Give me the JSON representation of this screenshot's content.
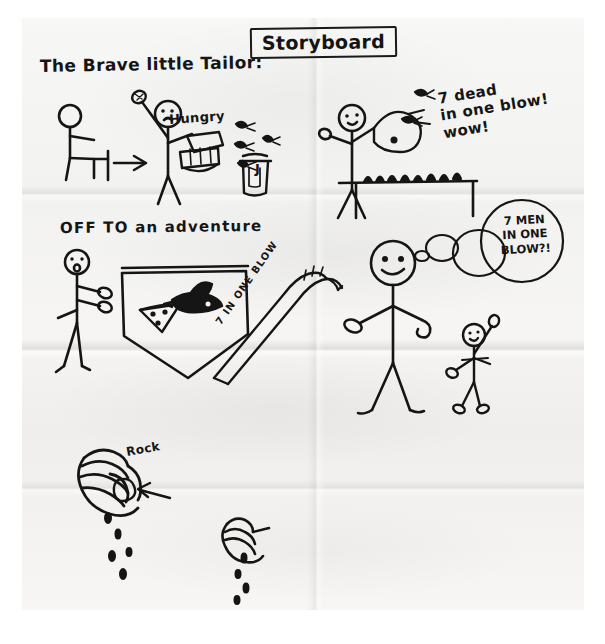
{
  "document": {
    "kind": "hand-drawn-storyboard",
    "title_box_label": "Storyboard",
    "story_title": "The Brave little Tailor:"
  },
  "panels": [
    {
      "id": "panel-1-hungry",
      "caption": "Hungry",
      "elements": [
        "seated-figure",
        "arrow-right",
        "standing-tailor",
        "fly-swatter",
        "sandwich",
        "jam-jar",
        "flies"
      ],
      "jam_jar_letter": "J"
    },
    {
      "id": "panel-2-seven-dead",
      "caption": "7 dead\nin one blow!\nwow!",
      "elements": [
        "tailor-figure",
        "swatter",
        "table",
        "squashed-flies"
      ]
    },
    {
      "id": "panel-3-adventure",
      "caption": "OFF TO an adventure",
      "elements": [
        "tailor-figure",
        "bindle-bag",
        "pizza-slice",
        "bird",
        "sash-banner",
        "big-tailor",
        "thought-bubbles",
        "small-figure"
      ],
      "sash_text": "7 IN ONE BLOW",
      "thought_bubble": "7 MEN\nIN ONE\nBLOW?!"
    },
    {
      "id": "panel-4-rock",
      "caption": "Rock",
      "elements": [
        "hand-squeezing-rock",
        "arrow-to-rock",
        "drips",
        "second-hand",
        "drips-2"
      ]
    }
  ],
  "colors": {
    "ink": "#151515",
    "paper": "#f4f3f1",
    "background": "#ffffff"
  }
}
